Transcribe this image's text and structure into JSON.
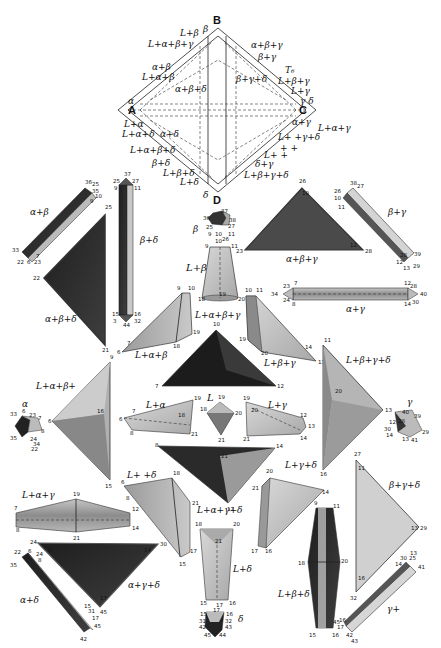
{
  "figure": {
    "type": "quaternary phase diagram model with exploded phase-region solids",
    "main_diagram": {
      "corners": {
        "top": "B",
        "bottom": "D",
        "left": "A",
        "right": "C"
      },
      "tag": "T₆",
      "labels_left": [
        "L+β",
        "β",
        "L+α+β+γ",
        "α+β",
        "L+α+β",
        "α",
        "L+α",
        "L+α+δ",
        "α+δ",
        "L+α+β+δ",
        "β+δ",
        "L+β+δ",
        "L+δ",
        "δ"
      ],
      "labels_inner": [
        "α+β+δ",
        "β+γ+δ"
      ],
      "labels_right": [
        "α+β+γ",
        "β+γ",
        "L+β+γ",
        "L+γ",
        "γ",
        "δ",
        "α+γ",
        "L+α+γ",
        "L+ +γ+δ",
        "+ +",
        "L+ +",
        "δ+γ",
        "L+β+γ+δ"
      ]
    },
    "pieces": [
      {
        "name": "α+β",
        "vertices": [
          "36",
          "25",
          "35",
          "10",
          "9",
          "33",
          "22",
          "6",
          "23",
          "7"
        ]
      },
      {
        "name": "β+δ",
        "vertices": [
          "25",
          "37",
          "27",
          "9",
          "11",
          "15",
          "16",
          "3",
          "44",
          "32"
        ]
      },
      {
        "name": "α+β+δ",
        "vertices": [
          "25",
          "22",
          "21"
        ]
      },
      {
        "name": "β",
        "vertices": [
          "36",
          "37",
          "38",
          "25",
          "27",
          "9",
          "10",
          "11",
          "26"
        ]
      },
      {
        "name": "L+β",
        "vertices": [
          "10",
          "9",
          "11",
          "18",
          "19",
          "20"
        ]
      },
      {
        "name": "α+β+γ",
        "vertices": [
          "26",
          "10",
          "23",
          "12",
          "28"
        ]
      },
      {
        "name": "β+γ",
        "vertices": [
          "38",
          "27",
          "26",
          "10",
          "11",
          "28",
          "39",
          "12",
          "13",
          "29"
        ]
      },
      {
        "name": "α+γ",
        "vertices": [
          "23",
          "7",
          "34",
          "24",
          "8",
          "12",
          "28",
          "40",
          "14",
          "30"
        ]
      },
      {
        "name": "L+α+β",
        "vertices": [
          "9",
          "10",
          "7",
          "6",
          "19",
          "18"
        ]
      },
      {
        "name": "L+α+β+γ",
        "vertices": [
          "10",
          "7",
          "12"
        ]
      },
      {
        "name": "L+β+γ",
        "vertices": [
          "10",
          "11",
          "19",
          "20",
          "14",
          "13"
        ]
      },
      {
        "name": "L+α+β+",
        "vertices": [
          "9",
          "6",
          "16",
          "15"
        ]
      },
      {
        "name": "L+β+γ+δ",
        "vertices": [
          "11",
          "20",
          "13",
          "16"
        ]
      },
      {
        "name": "α",
        "vertices": [
          "33",
          "6",
          "23",
          "7",
          "35",
          "24",
          "8",
          "22"
        ]
      },
      {
        "name": "L+α",
        "vertices": [
          "7",
          "6",
          "8",
          "18",
          "19",
          "21"
        ]
      },
      {
        "name": "L",
        "vertices": [
          "19",
          "18",
          "20",
          "21"
        ]
      },
      {
        "name": "L+γ",
        "vertices": [
          "19",
          "20",
          "12",
          "13",
          "14",
          "21"
        ]
      },
      {
        "name": "γ",
        "vertices": [
          "40",
          "39",
          "28",
          "12",
          "30",
          "14",
          "13",
          "41",
          "29"
        ]
      },
      {
        "name": "L+α+γ+δ",
        "vertices": [
          "8",
          "14",
          "21",
          "17"
        ]
      },
      {
        "name": "L+ +δ",
        "vertices": [
          "18",
          "6",
          "8",
          "21",
          "15",
          "17"
        ]
      },
      {
        "name": "L+γ+δ",
        "vertices": [
          "20",
          "21",
          "17",
          "16",
          "13",
          "14"
        ]
      },
      {
        "name": "β+γ+δ",
        "vertices": [
          "27",
          "11",
          "13",
          "29",
          "16",
          "32"
        ]
      },
      {
        "name": "L+α+γ",
        "vertices": [
          "19",
          "7",
          "8",
          "12",
          "14",
          "21"
        ]
      },
      {
        "name": "α+γ+δ",
        "vertices": [
          "24",
          "8",
          "30",
          "14",
          "17",
          "45"
        ]
      },
      {
        "name": "α+δ",
        "vertices": [
          "22",
          "6",
          "24",
          "8",
          "35",
          "15",
          "31",
          "17",
          "45",
          "42"
        ]
      },
      {
        "name": "L+δ",
        "vertices": [
          "18",
          "20",
          "21",
          "15",
          "17",
          "16"
        ]
      },
      {
        "name": "δ",
        "vertices": [
          "15",
          "17",
          "16",
          "31",
          "32",
          "42",
          "43",
          "45",
          "44"
        ]
      },
      {
        "name": "L+β+δ",
        "vertices": [
          "9",
          "11",
          "18",
          "20",
          "15",
          "16",
          "45"
        ]
      },
      {
        "name": "γ+",
        "vertices": [
          "13",
          "30",
          "25",
          "14",
          "41",
          "16",
          "17",
          "43"
        ]
      }
    ]
  },
  "colors": {
    "dark": "#2a2a2a",
    "mid": "#8a8a8a",
    "light": "#c8c8c8",
    "pale": "#e4e4e4",
    "line": "#222222"
  }
}
